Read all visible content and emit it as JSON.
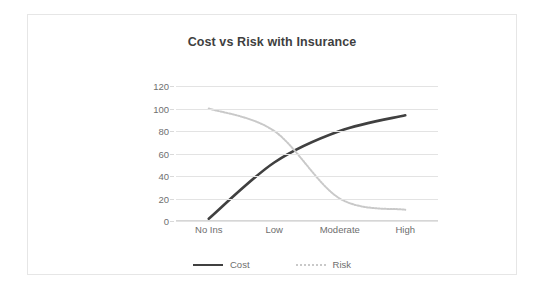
{
  "chart_data": {
    "type": "line",
    "title": "Cost vs Risk with Insurance",
    "xlabel": "",
    "ylabel": "",
    "categories": [
      "No Ins",
      "Low",
      "Moderate",
      "High"
    ],
    "series": [
      {
        "name": "Cost",
        "values": [
          2,
          52,
          80,
          94
        ],
        "color": "#404040",
        "style": "solid"
      },
      {
        "name": "Risk",
        "values": [
          100,
          80,
          20,
          10
        ],
        "color": "#c9c9c9",
        "style": "dotted"
      }
    ],
    "ylim": [
      0,
      120
    ],
    "yticks": [
      "0",
      "20",
      "40",
      "60",
      "80",
      "100",
      "120"
    ],
    "grid": "horizontal",
    "legend_position": "bottom",
    "smoothed": true
  }
}
